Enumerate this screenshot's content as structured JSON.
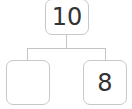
{
  "diagram": {
    "type": "number-bond",
    "whole": {
      "value": "10"
    },
    "parts": [
      {
        "value": ""
      },
      {
        "value": "8"
      }
    ],
    "colors": {
      "border": "#c8c8c8",
      "line": "#c4c4c4",
      "text": "#333333"
    }
  }
}
